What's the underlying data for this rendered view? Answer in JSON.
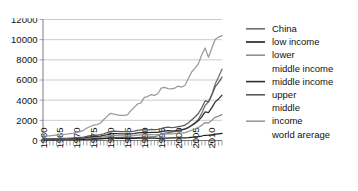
{
  "chart_data": {
    "type": "line",
    "title": "",
    "xlabel": "",
    "ylabel": "",
    "xlim": [
      1960,
      2013
    ],
    "ylim": [
      0,
      12000
    ],
    "yticks": [
      0,
      2000,
      4000,
      6000,
      8000,
      10000,
      12000
    ],
    "ytick_labels": [
      "0",
      "2000",
      "4000",
      "6000",
      "8000",
      "10000",
      "12000"
    ],
    "xticks": [
      1960,
      1965,
      1970,
      1975,
      1980,
      1985,
      1990,
      1995,
      2000,
      2005,
      2010
    ],
    "xtick_labels": [
      "1960",
      "1965",
      "1970",
      "1975",
      "1980",
      "1985",
      "1990",
      "1995",
      "2000",
      "2005",
      "2010"
    ],
    "grid": "horizontal",
    "legend_position": "right",
    "minor_xticks": "yearly",
    "x": [
      1960,
      1961,
      1962,
      1963,
      1964,
      1965,
      1966,
      1967,
      1968,
      1969,
      1970,
      1971,
      1972,
      1973,
      1974,
      1975,
      1976,
      1977,
      1978,
      1979,
      1980,
      1981,
      1982,
      1983,
      1984,
      1985,
      1986,
      1987,
      1988,
      1989,
      1990,
      1991,
      1992,
      1993,
      1994,
      1995,
      1996,
      1997,
      1998,
      1999,
      2000,
      2001,
      2002,
      2003,
      2004,
      2005,
      2006,
      2007,
      2008,
      2009,
      2010,
      2011,
      2012,
      2013
    ],
    "series": [
      {
        "name": "China",
        "color": "#6e6e6e",
        "legend_color": "#6e6e6e",
        "values": [
          90,
          75,
          70,
          74,
          85,
          98,
          104,
          96,
          91,
          100,
          113,
          118,
          131,
          157,
          160,
          178,
          165,
          185,
          230,
          260,
          309,
          288,
          280,
          290,
          310,
          294,
          282,
          252,
          284,
          311,
          318,
          333,
          366,
          377,
          473,
          610,
          709,
          781,
          828,
          873,
          959,
          1053,
          1149,
          1288,
          1508,
          1753,
          2099,
          2693,
          3468,
          3832,
          4550,
          5618,
          6317,
          7077
        ]
      },
      {
        "name": "low income",
        "color": "#1c1c1c",
        "legend_color": "#1c1c1c",
        "values": [
          62,
          64,
          66,
          70,
          72,
          76,
          78,
          80,
          82,
          86,
          95,
          100,
          107,
          125,
          140,
          150,
          155,
          165,
          180,
          200,
          225,
          225,
          220,
          215,
          212,
          210,
          205,
          215,
          230,
          235,
          240,
          235,
          230,
          225,
          222,
          230,
          240,
          245,
          250,
          252,
          255,
          258,
          265,
          285,
          315,
          350,
          390,
          445,
          520,
          525,
          560,
          625,
          665,
          700
        ]
      },
      {
        "name": "lower middle income",
        "color": "#8f8f8f",
        "legend_color": "#8f8f8f",
        "values": [
          110,
          112,
          116,
          125,
          130,
          135,
          138,
          145,
          152,
          162,
          178,
          188,
          200,
          240,
          275,
          300,
          305,
          320,
          360,
          415,
          480,
          490,
          480,
          470,
          465,
          470,
          465,
          490,
          530,
          555,
          570,
          565,
          580,
          570,
          580,
          610,
          665,
          690,
          660,
          680,
          720,
          740,
          790,
          890,
          1020,
          1150,
          1290,
          1510,
          1780,
          1740,
          2010,
          2300,
          2420,
          2560
        ]
      },
      {
        "name": "middle income",
        "color": "#2f2f2f",
        "legend_color": "#2f2f2f",
        "values": [
          130,
          133,
          138,
          148,
          156,
          163,
          170,
          176,
          186,
          200,
          220,
          235,
          258,
          310,
          365,
          400,
          412,
          440,
          505,
          580,
          675,
          690,
          680,
          660,
          655,
          660,
          650,
          690,
          745,
          780,
          800,
          790,
          810,
          800,
          815,
          870,
          945,
          980,
          945,
          960,
          1020,
          1045,
          1120,
          1280,
          1490,
          1700,
          1950,
          2350,
          2830,
          2760,
          3260,
          3830,
          4120,
          4500
        ]
      },
      {
        "name": "upper middle income",
        "color": "#5a5a5a",
        "legend_color": "#5a5a5a",
        "values": [
          160,
          164,
          170,
          182,
          193,
          204,
          214,
          222,
          236,
          255,
          282,
          302,
          333,
          402,
          475,
          525,
          542,
          580,
          670,
          775,
          905,
          928,
          912,
          884,
          878,
          886,
          872,
          926,
          1002,
          1050,
          1078,
          1064,
          1092,
          1078,
          1098,
          1175,
          1278,
          1328,
          1280,
          1300,
          1385,
          1420,
          1525,
          1745,
          2035,
          2330,
          2680,
          3240,
          3920,
          3830,
          4530,
          5340,
          5760,
          6300
        ]
      },
      {
        "name": "world arerage",
        "color": "#9a9a9a",
        "legend_color": "#9a9a9a",
        "values": [
          450,
          455,
          470,
          500,
          540,
          575,
          610,
          630,
          670,
          730,
          810,
          880,
          1010,
          1230,
          1390,
          1520,
          1570,
          1740,
          2080,
          2390,
          2700,
          2620,
          2540,
          2480,
          2480,
          2530,
          2960,
          3280,
          3620,
          3730,
          4280,
          4360,
          4560,
          4480,
          4640,
          5200,
          5260,
          5140,
          5130,
          5190,
          5400,
          5300,
          5460,
          6130,
          6790,
          7170,
          7600,
          8510,
          9170,
          8240,
          9170,
          10040,
          10260,
          10400
        ]
      }
    ]
  },
  "legend": {
    "entries": [
      {
        "label": "China"
      },
      {
        "label": "low income"
      },
      {
        "label": "lower"
      },
      {
        "label": "middle income"
      },
      {
        "label": "middle income"
      },
      {
        "label": "upper"
      },
      {
        "label": "middle"
      },
      {
        "label": "income"
      },
      {
        "label": "world arerage"
      }
    ]
  }
}
